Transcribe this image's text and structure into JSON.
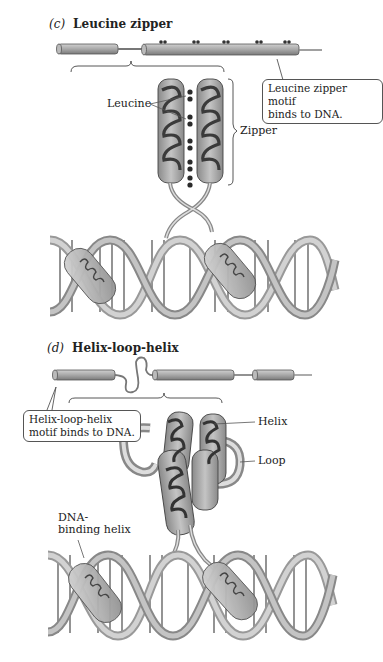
{
  "panels": [
    {
      "letter": "(c)",
      "title": "Leucine zipper",
      "callout": [
        "Leucine zipper motif",
        "binds to DNA."
      ],
      "labels": {
        "leucine": "Leucine",
        "zipper": "Zipper"
      }
    },
    {
      "letter": "(d)",
      "title": "Helix-loop-helix",
      "callout": [
        "Helix-loop-helix",
        "motif binds to DNA."
      ],
      "labels": {
        "helix": "Helix",
        "loop": "Loop",
        "dna_binding_helix": [
          "DNA-",
          "binding helix"
        ]
      }
    }
  ],
  "colors": {
    "protein": "#9a9a9a",
    "protein_dark": "#555555",
    "dna": "#b8b8b8",
    "outline": "#444444",
    "text": "#222222"
  }
}
